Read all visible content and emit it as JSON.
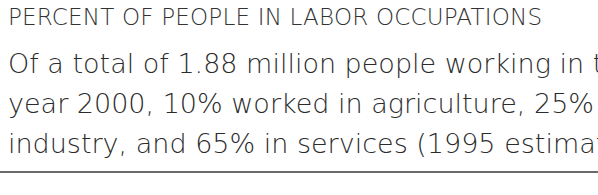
{
  "section": {
    "heading": "PERCENT OF PEOPLE IN LABOR OCCUPATIONS",
    "body_lines": [
      "Of a total of 1.88 million people working in the",
      "year 2000, 10% worked in agriculture, 25% in",
      "industry, and 65% in services (1995 estimate)."
    ]
  }
}
